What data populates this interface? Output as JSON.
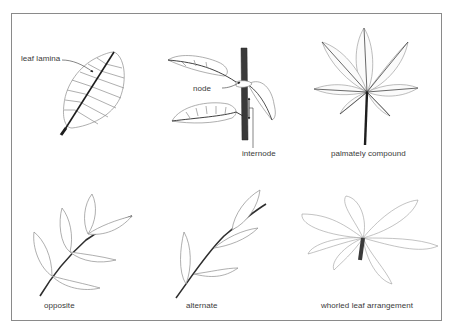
{
  "figure": {
    "colors": {
      "border": "#8a8a8a",
      "outline": "#8c8c8c",
      "midrib": "#1e1e1e",
      "stem": "#2e2e2e",
      "text": "#3a3a3a"
    },
    "panels": [
      {
        "id": "leaf-lamina",
        "labels": [
          "leaf lamina"
        ]
      },
      {
        "id": "node-internode",
        "labels": [
          "node",
          "internode"
        ]
      },
      {
        "id": "palmately-compound",
        "labels": [
          "palmately compound"
        ]
      },
      {
        "id": "opposite",
        "labels": [
          "opposite"
        ]
      },
      {
        "id": "alternate",
        "labels": [
          "alternate"
        ]
      },
      {
        "id": "whorled",
        "labels": [
          "whorled leaf arrangement"
        ]
      }
    ]
  },
  "labels": {
    "leaf_lamina": "leaf lamina",
    "node": "node",
    "internode": "internode",
    "palmately_compound": "palmately compound",
    "opposite": "opposite",
    "alternate": "alternate",
    "whorled": "whorled leaf arrangement"
  }
}
